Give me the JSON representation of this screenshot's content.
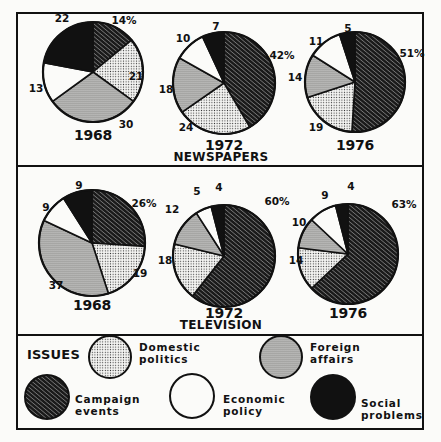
{
  "chart_data": {
    "type": "pie",
    "legend": {
      "title": "ISSUES",
      "entries": [
        {
          "key": "campaign_events",
          "label": "Campaign\nevents",
          "pattern": "dense-diagonal-hatch"
        },
        {
          "key": "domestic_politics",
          "label": "Domestic\npolitics",
          "pattern": "light-dots"
        },
        {
          "key": "foreign_affairs",
          "label": "Foreign\naffairs",
          "pattern": "dense-dots"
        },
        {
          "key": "economic_policy",
          "label": "Economic\npolicy",
          "pattern": "white"
        },
        {
          "key": "social_problems",
          "label": "Social\nproblems",
          "pattern": "solid-black"
        }
      ]
    },
    "slice_order": [
      "campaign_events",
      "domestic_politics",
      "foreign_affairs",
      "economic_policy",
      "social_problems"
    ],
    "panels": [
      {
        "title": "NEWSPAPERS",
        "charts": [
          {
            "year": "1968",
            "values": {
              "campaign_events": 14,
              "domestic_politics": 21,
              "foreign_affairs": 30,
              "economic_policy": 13,
              "social_problems": 22
            },
            "labels": [
              "14%",
              "21",
              "30",
              "13",
              "22"
            ]
          },
          {
            "year": "1972",
            "values": {
              "campaign_events": 42,
              "domestic_politics": 24,
              "foreign_affairs": 18,
              "economic_policy": 10,
              "social_problems": 7
            },
            "labels": [
              "42%",
              "24",
              "18",
              "10",
              "7"
            ]
          },
          {
            "year": "1976",
            "values": {
              "campaign_events": 51,
              "domestic_politics": 19,
              "foreign_affairs": 14,
              "economic_policy": 11,
              "social_problems": 5
            },
            "labels": [
              "51%",
              "19",
              "14",
              "11",
              "5"
            ]
          }
        ]
      },
      {
        "title": "TELEVISION",
        "charts": [
          {
            "year": "1968",
            "values": {
              "campaign_events": 26,
              "domestic_politics": 19,
              "foreign_affairs": 37,
              "economic_policy": 9,
              "social_problems": 9
            },
            "labels": [
              "26%",
              "19",
              "37",
              "9",
              "9"
            ]
          },
          {
            "year": "1972",
            "values": {
              "campaign_events": 60,
              "domestic_politics": 18,
              "foreign_affairs": 12,
              "economic_policy": 5,
              "social_problems": 4
            },
            "labels": [
              "60%",
              "18",
              "12",
              "5",
              "4"
            ]
          },
          {
            "year": "1976",
            "values": {
              "campaign_events": 63,
              "domestic_politics": 14,
              "foreign_affairs": 10,
              "economic_policy": 9,
              "social_problems": 4
            },
            "labels": [
              "63%",
              "14",
              "10",
              "9",
              "4"
            ]
          }
        ]
      }
    ],
    "units": "percent"
  },
  "layout": {
    "pies": [
      {
        "panel": 0,
        "chart": 0,
        "cx": 93,
        "cy": 72,
        "r": 50,
        "year_y": 140,
        "label_pos": [
          [
            124,
            24
          ],
          [
            136,
            80
          ],
          [
            126,
            128
          ],
          [
            36,
            92
          ],
          [
            62,
            22
          ]
        ]
      },
      {
        "panel": 0,
        "chart": 1,
        "cx": 224,
        "cy": 83,
        "r": 51,
        "year_y": 150,
        "label_pos": [
          [
            282,
            59
          ],
          [
            186,
            131
          ],
          [
            166,
            93
          ],
          [
            183,
            42
          ],
          [
            216,
            30
          ]
        ]
      },
      {
        "panel": 0,
        "chart": 2,
        "cx": 355,
        "cy": 82,
        "r": 50,
        "year_y": 150,
        "label_pos": [
          [
            412,
            57
          ],
          [
            316,
            131
          ],
          [
            295,
            81
          ],
          [
            316,
            45
          ],
          [
            348,
            32
          ]
        ]
      },
      {
        "panel": 1,
        "chart": 0,
        "cx": 92,
        "cy": 243,
        "r": 53,
        "year_y": 310,
        "label_pos": [
          [
            144,
            207
          ],
          [
            140,
            277
          ],
          [
            56,
            289
          ],
          [
            46,
            211
          ],
          [
            79,
            189
          ]
        ]
      },
      {
        "panel": 1,
        "chart": 1,
        "cx": 224,
        "cy": 256,
        "r": 51,
        "year_y": 318,
        "label_pos": [
          [
            277,
            205
          ],
          [
            165,
            264
          ],
          [
            172,
            213
          ],
          [
            197,
            195
          ],
          [
            219,
            191
          ]
        ]
      },
      {
        "panel": 1,
        "chart": 2,
        "cx": 348,
        "cy": 254,
        "r": 50,
        "year_y": 318,
        "label_pos": [
          [
            404,
            208
          ],
          [
            296,
            264
          ],
          [
            299,
            226
          ],
          [
            325,
            199
          ],
          [
            351,
            190
          ]
        ]
      }
    ],
    "panel_titles": [
      {
        "x": 221,
        "y": 161
      },
      {
        "x": 221,
        "y": 329
      }
    ],
    "colors": {
      "ink": "#111111",
      "paper": "#fbfbf9"
    }
  }
}
